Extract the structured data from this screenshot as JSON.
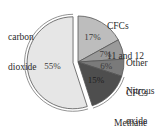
{
  "chart_data": {
    "type": "pie",
    "title": "",
    "exploded": [
      "carbon dioxide"
    ],
    "slices": [
      {
        "label": "carbon dioxide",
        "label_lines": [
          "carbon",
          "dioxide"
        ],
        "value": 55,
        "value_label": "55%",
        "color": "#e6e6e6"
      },
      {
        "label": "CFCs 11 and 12",
        "label_lines": [
          "CFCs",
          "11 and 12"
        ],
        "value": 17,
        "value_label": "17%",
        "color": "#bdbdbd"
      },
      {
        "label": "Other CFCs",
        "label_lines": [
          "Other",
          "CFCs"
        ],
        "value": 7,
        "value_label": "7%",
        "color": "#9a9a9a"
      },
      {
        "label": "Nitrous oxide",
        "label_lines": [
          "Nitrous",
          "oxide"
        ],
        "value": 6,
        "value_label": "6%",
        "color": "#7a7a7a"
      },
      {
        "label": "Methane",
        "label_lines": [
          "Methane"
        ],
        "value": 15,
        "value_label": "15%",
        "color": "#4e4e4e"
      }
    ]
  }
}
